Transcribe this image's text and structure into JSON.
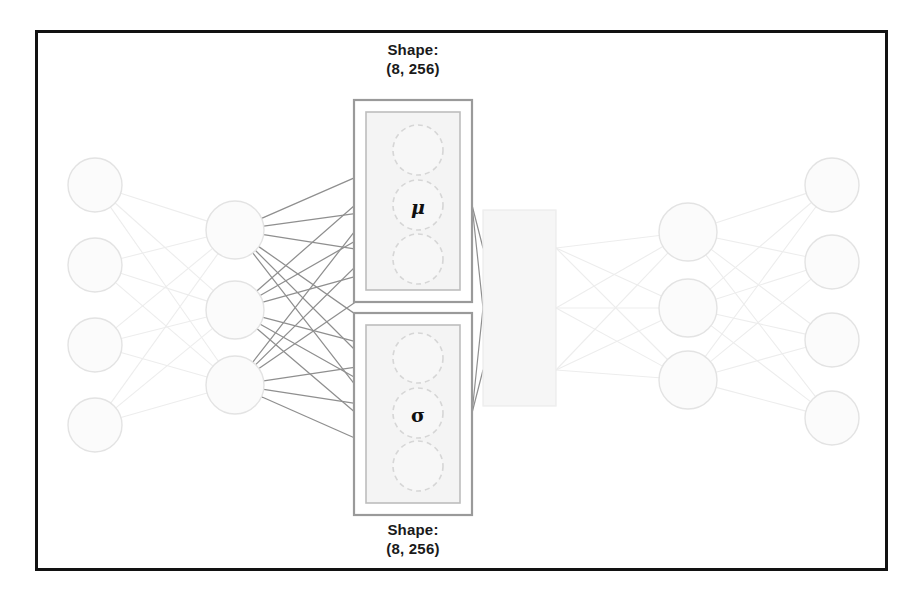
{
  "diagram": {
    "kind": "variational-autoencoder-architecture",
    "background_color": "#ffffff",
    "frame": {
      "x": 35,
      "y": 30,
      "width": 853,
      "height": 541,
      "border_color": "#121212",
      "border_width": 3
    },
    "labels": {
      "shape_top": "Shape:\n(8, 256)",
      "shape_bottom": "Shape:\n(8, 256)",
      "mu_symbol": "μ",
      "sigma_symbol": "σ"
    },
    "colors": {
      "node_stroke": "#e3e3e3",
      "node_fill": "#fbfbfb",
      "edge_faint": "#ededed",
      "edge_dark": "#8f8f8f",
      "dashed_circle_stroke": "#d6d6d6",
      "dashed_circle_fill": "#f7f7f7",
      "box_outer_stroke": "#9a9a9a",
      "box_inner_stroke": "#bdbdbd",
      "box_inner_fill": "#f4f4f4",
      "latent_box_fill": "#f6f6f6",
      "latent_box_stroke": "#ececec",
      "text": "#1a1a1a"
    },
    "layers": [
      {
        "name": "input-layer",
        "role": "input",
        "node_count": 4,
        "node_radius": 27,
        "nodes": [
          {
            "cx": 95,
            "cy": 185
          },
          {
            "cx": 95,
            "cy": 265
          },
          {
            "cx": 95,
            "cy": 345
          },
          {
            "cx": 95,
            "cy": 425
          }
        ]
      },
      {
        "name": "encoder-hidden-layer",
        "role": "encoder-hidden",
        "node_count": 3,
        "node_radius": 29,
        "nodes": [
          {
            "cx": 235,
            "cy": 230
          },
          {
            "cx": 235,
            "cy": 310
          },
          {
            "cx": 235,
            "cy": 385
          }
        ]
      },
      {
        "name": "mu-layer",
        "role": "latent-mean",
        "node_count": 3,
        "node_radius": 25,
        "nodes": [
          {
            "cx": 418,
            "cy": 150
          },
          {
            "cx": 418,
            "cy": 205
          },
          {
            "cx": 418,
            "cy": 259
          }
        ]
      },
      {
        "name": "sigma-layer",
        "role": "latent-stddev",
        "node_count": 3,
        "node_radius": 25,
        "nodes": [
          {
            "cx": 418,
            "cy": 358
          },
          {
            "cx": 418,
            "cy": 413
          },
          {
            "cx": 418,
            "cy": 466
          }
        ]
      },
      {
        "name": "decoder-hidden-layer",
        "role": "decoder-hidden",
        "node_count": 3,
        "node_radius": 29,
        "nodes": [
          {
            "cx": 688,
            "cy": 232
          },
          {
            "cx": 688,
            "cy": 308
          },
          {
            "cx": 688,
            "cy": 380
          }
        ]
      },
      {
        "name": "output-layer",
        "role": "output",
        "node_count": 4,
        "node_radius": 27,
        "nodes": [
          {
            "cx": 832,
            "cy": 185
          },
          {
            "cx": 832,
            "cy": 262
          },
          {
            "cx": 832,
            "cy": 340
          },
          {
            "cx": 832,
            "cy": 418
          }
        ]
      }
    ],
    "boxes": {
      "mu_outer": {
        "x": 354,
        "y": 100,
        "width": 118,
        "height": 202
      },
      "mu_inner": {
        "x": 366,
        "y": 112,
        "width": 94,
        "height": 178
      },
      "sigma_outer": {
        "x": 354,
        "y": 313,
        "width": 118,
        "height": 202
      },
      "sigma_inner": {
        "x": 366,
        "y": 325,
        "width": 94,
        "height": 178
      },
      "latent": {
        "x": 483,
        "y": 210,
        "width": 73,
        "height": 196
      }
    },
    "latent_ports": [
      {
        "x": 556,
        "y": 248
      },
      {
        "x": 556,
        "y": 308
      },
      {
        "x": 556,
        "y": 370
      }
    ],
    "latent_in_ports": [
      {
        "x": 483,
        "y": 248
      },
      {
        "x": 483,
        "y": 308
      },
      {
        "x": 483,
        "y": 370
      }
    ],
    "mu_out_port": {
      "x": 472,
      "y": 205
    },
    "sigma_out_port": {
      "x": 472,
      "y": 413
    }
  }
}
